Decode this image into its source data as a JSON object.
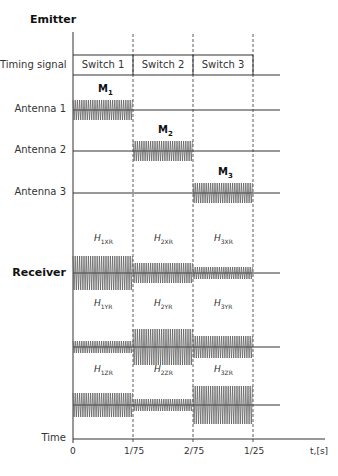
{
  "sections": {
    "emitter": "Emitter",
    "receiver": "Receiver"
  },
  "rows": {
    "timing_signal": "Timing signal",
    "antenna1": "Antenna 1",
    "antenna2": "Antenna 2",
    "antenna3": "Antenna 3",
    "time": "Time"
  },
  "switches": [
    "Switch 1",
    "Switch 2",
    "Switch 3"
  ],
  "emitter_signals": [
    {
      "label": "M",
      "sub": "1",
      "antenna": "Antenna 1",
      "interval": "0-1/75"
    },
    {
      "label": "M",
      "sub": "2",
      "antenna": "Antenna 2",
      "interval": "1/75-2/75"
    },
    {
      "label": "M",
      "sub": "3",
      "antenna": "Antenna 3",
      "interval": "2/75-1/25"
    }
  ],
  "receiver_labels": {
    "x": [
      {
        "h": "H",
        "sub": "1XR"
      },
      {
        "h": "H",
        "sub": "2XR"
      },
      {
        "h": "H",
        "sub": "3XR"
      }
    ],
    "y": [
      {
        "h": "H",
        "sub": "1YR"
      },
      {
        "h": "H",
        "sub": "2YR"
      },
      {
        "h": "H",
        "sub": "3YR"
      }
    ],
    "z": [
      {
        "h": "H",
        "sub": "1ZR"
      },
      {
        "h": "H",
        "sub": "2ZR"
      },
      {
        "h": "H",
        "sub": "3ZR"
      }
    ]
  },
  "receiver_amplitudes": {
    "x": [
      17,
      10,
      6
    ],
    "y": [
      6,
      18,
      11
    ],
    "z": [
      12,
      6,
      19
    ]
  },
  "time_axis": {
    "ticks": [
      "0",
      "1/75",
      "2/75",
      "1/25"
    ],
    "unit_label": "t,[s]"
  }
}
